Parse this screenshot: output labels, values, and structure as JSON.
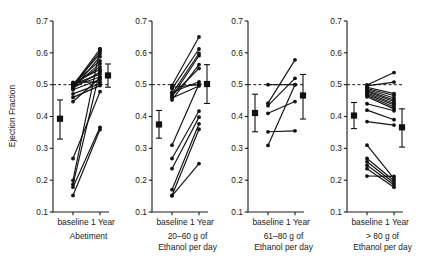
{
  "figure": {
    "ylabel": "Ejection Fraction",
    "y_ticks": [
      "0.7",
      "0.6",
      "0.5",
      "0.4",
      "0.3",
      "0.2",
      "0.1"
    ],
    "x_ticks": [
      "baseline",
      "1 Year"
    ],
    "reference_line_value": 0.5
  },
  "chart_data": {
    "type": "line",
    "title": "",
    "xlabel": "",
    "ylabel": "Ejection Fraction",
    "ylim": [
      0.1,
      0.7
    ],
    "ytick_values": [
      0.7,
      0.6,
      0.5,
      0.4,
      0.3,
      0.2,
      0.1
    ],
    "x": [
      "baseline",
      "1 Year"
    ],
    "grid": false,
    "legend": "none",
    "reference_line": 0.5,
    "panels": [
      {
        "id": "abetiment",
        "caption_lines": [
          "Abetiment"
        ],
        "xtick_labels": [
          "baseline",
          "1 Year"
        ],
        "mean": {
          "baseline": {
            "value": 0.393,
            "low": 0.329,
            "high": 0.452
          },
          "one_year": {
            "value": 0.529,
            "low": 0.492,
            "high": 0.565
          }
        },
        "subjects": [
          {
            "baseline": 0.497,
            "one_year": 0.612
          },
          {
            "baseline": 0.492,
            "one_year": 0.605
          },
          {
            "baseline": 0.5,
            "one_year": 0.597
          },
          {
            "baseline": 0.487,
            "one_year": 0.588
          },
          {
            "baseline": 0.503,
            "one_year": 0.575
          },
          {
            "baseline": 0.494,
            "one_year": 0.566
          },
          {
            "baseline": 0.498,
            "one_year": 0.556
          },
          {
            "baseline": 0.505,
            "one_year": 0.548
          },
          {
            "baseline": 0.489,
            "one_year": 0.54
          },
          {
            "baseline": 0.501,
            "one_year": 0.533
          },
          {
            "baseline": 0.496,
            "one_year": 0.524
          },
          {
            "baseline": 0.484,
            "one_year": 0.516
          },
          {
            "baseline": 0.507,
            "one_year": 0.509
          },
          {
            "baseline": 0.471,
            "one_year": 0.503
          },
          {
            "baseline": 0.46,
            "one_year": 0.497
          },
          {
            "baseline": 0.447,
            "one_year": 0.521
          },
          {
            "baseline": 0.268,
            "one_year": 0.478
          },
          {
            "baseline": 0.199,
            "one_year": 0.612
          },
          {
            "baseline": 0.187,
            "one_year": 0.545
          },
          {
            "baseline": 0.178,
            "one_year": 0.366
          },
          {
            "baseline": 0.152,
            "one_year": 0.359
          }
        ]
      },
      {
        "id": "ethanol-20-60",
        "caption_lines": [
          "20–60 g of",
          "Ethanol per day"
        ],
        "xtick_labels": [
          "baseline",
          "1 Year"
        ],
        "mean": {
          "baseline": {
            "value": 0.375,
            "low": 0.332,
            "high": 0.419
          },
          "one_year": {
            "value": 0.502,
            "low": 0.441,
            "high": 0.563
          }
        },
        "subjects": [
          {
            "baseline": 0.498,
            "one_year": 0.65
          },
          {
            "baseline": 0.487,
            "one_year": 0.612
          },
          {
            "baseline": 0.472,
            "one_year": 0.598
          },
          {
            "baseline": 0.462,
            "one_year": 0.591
          },
          {
            "baseline": 0.452,
            "one_year": 0.563
          },
          {
            "baseline": 0.466,
            "one_year": 0.551
          },
          {
            "baseline": 0.476,
            "one_year": 0.509
          },
          {
            "baseline": 0.492,
            "one_year": 0.5
          },
          {
            "baseline": 0.458,
            "one_year": 0.496
          },
          {
            "baseline": 0.31,
            "one_year": 0.502
          },
          {
            "baseline": 0.268,
            "one_year": 0.417
          },
          {
            "baseline": 0.236,
            "one_year": 0.398
          },
          {
            "baseline": 0.17,
            "one_year": 0.377
          },
          {
            "baseline": 0.152,
            "one_year": 0.36
          },
          {
            "baseline": 0.151,
            "one_year": 0.252
          }
        ]
      },
      {
        "id": "ethanol-61-80",
        "caption_lines": [
          "61–80 g of",
          "Ethanol per day"
        ],
        "xtick_labels": [
          "baseline",
          "1 Year"
        ],
        "mean": {
          "baseline": {
            "value": 0.411,
            "low": 0.352,
            "high": 0.47
          },
          "one_year": {
            "value": 0.466,
            "low": 0.392,
            "high": 0.532
          }
        },
        "subjects": [
          {
            "baseline": 0.5,
            "one_year": 0.5
          },
          {
            "baseline": 0.442,
            "one_year": 0.578
          },
          {
            "baseline": 0.434,
            "one_year": 0.52
          },
          {
            "baseline": 0.41,
            "one_year": 0.447
          },
          {
            "baseline": 0.352,
            "one_year": 0.355
          },
          {
            "baseline": 0.309,
            "one_year": 0.5
          }
        ]
      },
      {
        "id": "ethanol-over-80",
        "caption_lines": [
          "> 80 g of",
          "Ethanol per day"
        ],
        "xtick_labels": [
          "baseline",
          "1 Year"
        ],
        "mean": {
          "baseline": {
            "value": 0.403,
            "low": 0.362,
            "high": 0.444
          },
          "one_year": {
            "value": 0.366,
            "low": 0.304,
            "high": 0.424
          }
        },
        "subjects": [
          {
            "baseline": 0.499,
            "one_year": 0.538
          },
          {
            "baseline": 0.496,
            "one_year": 0.508
          },
          {
            "baseline": 0.492,
            "one_year": 0.472
          },
          {
            "baseline": 0.488,
            "one_year": 0.466
          },
          {
            "baseline": 0.485,
            "one_year": 0.458
          },
          {
            "baseline": 0.481,
            "one_year": 0.452
          },
          {
            "baseline": 0.478,
            "one_year": 0.447
          },
          {
            "baseline": 0.474,
            "one_year": 0.441
          },
          {
            "baseline": 0.47,
            "one_year": 0.436
          },
          {
            "baseline": 0.466,
            "one_year": 0.43
          },
          {
            "baseline": 0.462,
            "one_year": 0.424
          },
          {
            "baseline": 0.44,
            "one_year": 0.418
          },
          {
            "baseline": 0.42,
            "one_year": 0.39
          },
          {
            "baseline": 0.384,
            "one_year": 0.373
          },
          {
            "baseline": 0.31,
            "one_year": 0.205
          },
          {
            "baseline": 0.268,
            "one_year": 0.198
          },
          {
            "baseline": 0.258,
            "one_year": 0.191
          },
          {
            "baseline": 0.247,
            "one_year": 0.185
          },
          {
            "baseline": 0.236,
            "one_year": 0.178
          },
          {
            "baseline": 0.213,
            "one_year": 0.212
          }
        ]
      }
    ]
  }
}
